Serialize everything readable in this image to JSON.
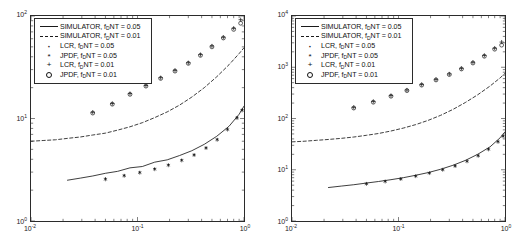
{
  "figure": {
    "background": "#ffffff",
    "axis_color": "#2b2b2b",
    "data_color": "#1a1a1a"
  },
  "legend_labels": {
    "sim_005": "SIMULATOR, f_DNT = 0.05",
    "sim_001": "SIMULATOR, f_DNT = 0.01",
    "lcr_005": "LCR, f_DNT = 0.05",
    "jpdf_005": "JPDF, f_DNT = 0.05",
    "lcr_001": "LCR, f_DNT = 0.01",
    "jpdf_001": "JPDF, f_DNT = 0.01",
    "prefix_sim": "SIMULATOR, f",
    "prefix_lcr": "LCR, f",
    "prefix_jpdf": "JPDF, f",
    "sub_d": "D",
    "suffix_005": "NT = 0.05",
    "suffix_001": "NT = 0.01"
  },
  "marker_glyphs": {
    "dot": "·",
    "asterisk": "*",
    "plus": "+",
    "circle": "○"
  },
  "axis_labels": {
    "x_ticks": [
      "10",
      "10",
      "10"
    ],
    "x_exps": [
      "-2",
      "-1",
      "0"
    ],
    "y_left_ticks": [
      "10",
      "10",
      "10"
    ],
    "y_left_exps": [
      "0",
      "1",
      "2"
    ],
    "y_right_ticks": [
      "10",
      "10",
      "10",
      "10",
      "10"
    ],
    "y_right_exps": [
      "0",
      "1",
      "2",
      "3",
      "4"
    ]
  },
  "chart_data": [
    {
      "type": "line",
      "panel": "left",
      "title": "",
      "xlabel": "",
      "ylabel": "",
      "xscale": "log",
      "yscale": "log",
      "xlim": [
        0.01,
        1.0
      ],
      "ylim": [
        1.0,
        100.0
      ],
      "grid": false,
      "legend_position": "upper-left",
      "x_tick_values": [
        0.01,
        0.1,
        1.0
      ],
      "y_tick_values": [
        1,
        10,
        100
      ],
      "series": [
        {
          "name": "SIMULATOR, f_DNT = 0.01",
          "style": "dashed",
          "marker": "none",
          "x": [
            0.01,
            0.013,
            0.017,
            0.022,
            0.029,
            0.038,
            0.05,
            0.065,
            0.085,
            0.111,
            0.145,
            0.19,
            0.248,
            0.324,
            0.424,
            0.554,
            0.724,
            0.9,
            1.0
          ],
          "y": [
            6.0,
            6.1,
            6.2,
            6.4,
            6.6,
            6.9,
            7.2,
            7.7,
            8.3,
            9.1,
            10.2,
            11.6,
            13.5,
            16.2,
            20.0,
            25.5,
            33.5,
            43.0,
            49.0
          ]
        },
        {
          "name": "SIMULATOR, f_DNT = 0.05",
          "style": "solid",
          "marker": "none",
          "x": [
            0.022,
            0.029,
            0.038,
            0.05,
            0.065,
            0.085,
            0.111,
            0.145,
            0.19,
            0.248,
            0.324,
            0.424,
            0.554,
            0.724,
            0.9,
            1.0
          ],
          "y": [
            2.5,
            2.62,
            2.75,
            2.92,
            3.05,
            3.3,
            3.4,
            3.75,
            3.95,
            4.35,
            4.85,
            5.6,
            6.7,
            8.4,
            11.0,
            13.2
          ]
        },
        {
          "name": "LCR, f_DNT = 0.01",
          "style": "none",
          "marker": "plus",
          "x": [
            0.038,
            0.058,
            0.085,
            0.12,
            0.165,
            0.225,
            0.3,
            0.39,
            0.5,
            0.64,
            0.8,
            0.93
          ],
          "y": [
            11.5,
            14.0,
            17.5,
            21.0,
            25.0,
            29.5,
            35.0,
            42.0,
            51.0,
            62.0,
            76.0,
            92.0
          ]
        },
        {
          "name": "JPDF, f_DNT = 0.01",
          "style": "none",
          "marker": "circle",
          "x": [
            0.038,
            0.058,
            0.085,
            0.12,
            0.165,
            0.225,
            0.3,
            0.39,
            0.5,
            0.64,
            0.8,
            0.93
          ],
          "y": [
            11.3,
            13.8,
            17.2,
            20.7,
            24.6,
            29.0,
            34.5,
            41.3,
            50.0,
            61.0,
            74.0,
            85.0
          ]
        },
        {
          "name": "LCR, f_DNT = 0.05",
          "style": "none",
          "marker": "dot",
          "x": [
            0.05,
            0.075,
            0.105,
            0.145,
            0.195,
            0.26,
            0.34,
            0.44,
            0.56,
            0.7,
            0.86,
            0.96
          ],
          "y": [
            2.6,
            2.8,
            3.0,
            3.25,
            3.55,
            3.95,
            4.45,
            5.2,
            6.3,
            7.9,
            10.3,
            12.2
          ]
        },
        {
          "name": "JPDF, f_DNT = 0.05",
          "style": "none",
          "marker": "asterisk",
          "x": [
            0.05,
            0.075,
            0.105,
            0.145,
            0.195,
            0.26,
            0.34,
            0.44,
            0.56,
            0.7,
            0.86,
            0.96
          ],
          "y": [
            2.55,
            2.76,
            2.96,
            3.2,
            3.5,
            3.9,
            4.4,
            5.15,
            6.2,
            7.8,
            10.1,
            12.0
          ]
        }
      ]
    },
    {
      "type": "line",
      "panel": "right",
      "title": "",
      "xlabel": "",
      "ylabel": "",
      "xscale": "log",
      "yscale": "log",
      "xlim": [
        0.01,
        1.0
      ],
      "ylim": [
        1.0,
        10000.0
      ],
      "grid": false,
      "legend_position": "upper-left",
      "x_tick_values": [
        0.01,
        0.1,
        1.0
      ],
      "y_tick_values": [
        1,
        10,
        100,
        1000,
        10000
      ],
      "series": [
        {
          "name": "SIMULATOR, f_DNT = 0.01",
          "style": "dashed",
          "marker": "none",
          "x": [
            0.01,
            0.013,
            0.017,
            0.022,
            0.029,
            0.038,
            0.05,
            0.065,
            0.085,
            0.111,
            0.145,
            0.19,
            0.248,
            0.324,
            0.424,
            0.554,
            0.724,
            0.9,
            1.0
          ],
          "y": [
            35.0,
            36.0,
            37.5,
            39.0,
            41.0,
            43.5,
            47.0,
            51.0,
            57.0,
            65.0,
            76.0,
            92.0,
            115.0,
            150.0,
            205.0,
            290.0,
            430.0,
            620.0,
            760.0
          ]
        },
        {
          "name": "SIMULATOR, f_DNT = 0.05",
          "style": "solid",
          "marker": "none",
          "x": [
            0.022,
            0.029,
            0.038,
            0.05,
            0.065,
            0.085,
            0.111,
            0.145,
            0.19,
            0.248,
            0.324,
            0.424,
            0.554,
            0.724,
            0.9,
            1.0
          ],
          "y": [
            4.5,
            4.8,
            5.1,
            5.5,
            5.9,
            6.4,
            7.0,
            7.8,
            8.8,
            10.2,
            12.2,
            15.2,
            20.0,
            28.0,
            42.0,
            55.0
          ]
        },
        {
          "name": "LCR, f_DNT = 0.01",
          "style": "none",
          "marker": "plus",
          "x": [
            0.038,
            0.058,
            0.085,
            0.12,
            0.165,
            0.225,
            0.3,
            0.39,
            0.5,
            0.64,
            0.8,
            0.93
          ],
          "y": [
            165.0,
            215.0,
            280.0,
            360.0,
            460.0,
            580.0,
            740.0,
            950.0,
            1250.0,
            1700.0,
            2350.0,
            3100.0
          ]
        },
        {
          "name": "JPDF, f_DNT = 0.01",
          "style": "none",
          "marker": "circle",
          "x": [
            0.038,
            0.058,
            0.085,
            0.12,
            0.165,
            0.225,
            0.3,
            0.39,
            0.5,
            0.64,
            0.8,
            0.93
          ],
          "y": [
            160.0,
            208.0,
            272.0,
            350.0,
            448.0,
            565.0,
            720.0,
            925.0,
            1210.0,
            1640.0,
            2250.0,
            2700.0
          ]
        },
        {
          "name": "LCR, f_DNT = 0.05",
          "style": "none",
          "marker": "dot",
          "x": [
            0.05,
            0.075,
            0.105,
            0.145,
            0.195,
            0.26,
            0.34,
            0.44,
            0.56,
            0.7,
            0.86,
            0.96
          ],
          "y": [
            5.4,
            6.0,
            6.7,
            7.6,
            8.7,
            10.1,
            12.0,
            14.8,
            19.0,
            25.5,
            36.0,
            46.0
          ]
        },
        {
          "name": "JPDF, f_DNT = 0.05",
          "style": "none",
          "marker": "asterisk",
          "x": [
            0.05,
            0.075,
            0.105,
            0.145,
            0.195,
            0.26,
            0.34,
            0.44,
            0.56,
            0.7,
            0.86,
            0.96
          ],
          "y": [
            5.3,
            5.9,
            6.6,
            7.5,
            8.6,
            10.0,
            11.8,
            14.6,
            18.7,
            25.0,
            35.0,
            45.0
          ]
        }
      ]
    }
  ]
}
